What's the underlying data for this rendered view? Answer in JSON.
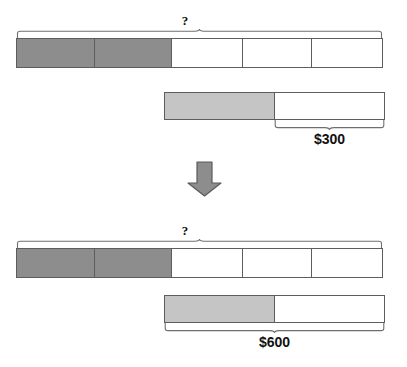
{
  "diagram": {
    "type": "bar-model",
    "title": "",
    "colors": {
      "dark_gray": "#8d8d8d",
      "light_gray": "#c5c5c5",
      "white": "#ffffff",
      "outline": "#5d5d5d",
      "arrow_fill": "#8d8d8d",
      "arrow_stroke": "#5a5a5a",
      "text": "#111111"
    },
    "panels": [
      {
        "id": "before",
        "name": "top-panel",
        "unknown_label": "?",
        "long_bar": {
          "name": "top-long-bar",
          "units": 5,
          "filled_units": 2,
          "segments": [
            "dark",
            "dark",
            "empty",
            "empty",
            "empty"
          ]
        },
        "short_bar": {
          "name": "top-short-bar",
          "units": 2,
          "segments": [
            "light",
            "empty"
          ]
        },
        "amount_label": "$300",
        "amount_value": 300,
        "brace_span": "short-bar-white-part"
      },
      {
        "id": "after",
        "name": "bottom-panel",
        "unknown_label": "?",
        "long_bar": {
          "name": "bottom-long-bar",
          "units": 5,
          "filled_units": 2,
          "segments": [
            "dark",
            "dark",
            "empty",
            "empty",
            "empty"
          ]
        },
        "short_bar": {
          "name": "bottom-short-bar",
          "units": 2,
          "segments": [
            "light",
            "empty"
          ]
        },
        "amount_label": "$600",
        "amount_value": 600,
        "brace_span": "short-bar-full"
      }
    ],
    "arrow": {
      "name": "down-arrow",
      "direction": "down"
    }
  }
}
